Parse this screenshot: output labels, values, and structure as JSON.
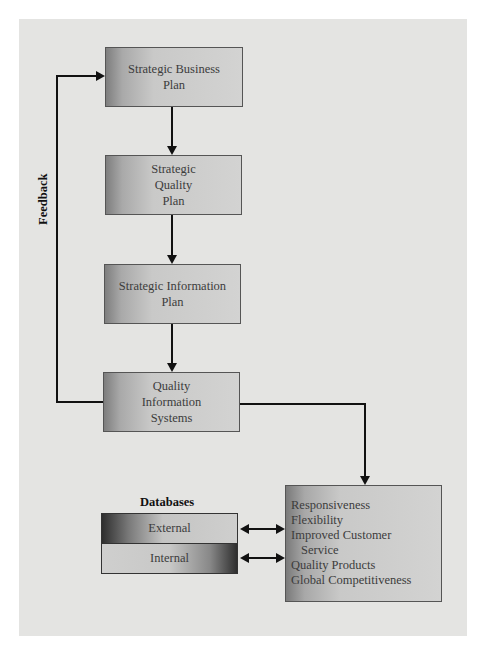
{
  "diagram": {
    "nodes": {
      "strategic_business_plan": [
        "Strategic Business",
        "Plan"
      ],
      "strategic_quality_plan": [
        "Strategic",
        "Quality",
        "Plan"
      ],
      "strategic_information_plan": [
        "Strategic Information",
        "Plan"
      ],
      "quality_information_systems": [
        "Quality",
        "Information",
        "Systems"
      ]
    },
    "feedback_label": "Feedback",
    "databases": {
      "title": "Databases",
      "items": [
        "External",
        "Internal"
      ]
    },
    "benefits": {
      "items": [
        "Responsiveness",
        "Flexibility",
        "Improved Customer",
        "Service",
        "Quality Products",
        "Global Competitiveness"
      ]
    },
    "edges": [
      {
        "from": "Strategic Business Plan",
        "to": "Strategic Quality Plan"
      },
      {
        "from": "Strategic Quality Plan",
        "to": "Strategic Information Plan"
      },
      {
        "from": "Strategic Information Plan",
        "to": "Quality Information Systems"
      },
      {
        "from": "Quality Information Systems",
        "to": "Strategic Business Plan",
        "label": "Feedback"
      },
      {
        "from": "Quality Information Systems",
        "to": "Benefits"
      },
      {
        "from": "External",
        "to": "Benefits",
        "bidirectional": true
      },
      {
        "from": "Internal",
        "to": "Benefits",
        "bidirectional": true
      }
    ]
  }
}
